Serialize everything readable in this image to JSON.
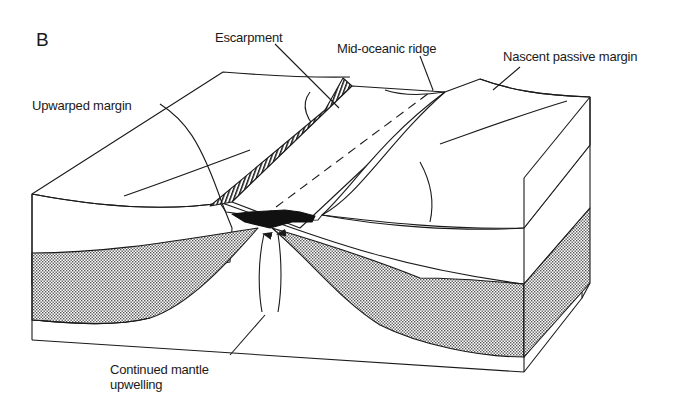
{
  "figure": {
    "panel_letter": "B",
    "colors": {
      "ink": "#1a1a1a",
      "stipple_fill": "#9a9a9a",
      "magma_fill": "#111111",
      "background": "#ffffff"
    }
  },
  "labels": {
    "escarpment": "Escarpment",
    "mid_oceanic_ridge": "Mid-oceanic ridge",
    "nascent_passive_margin": "Nascent passive margin",
    "upwarped_margin": "Upwarped margin",
    "mantle_line1": "Continued mantle",
    "mantle_line2": "upwelling"
  }
}
